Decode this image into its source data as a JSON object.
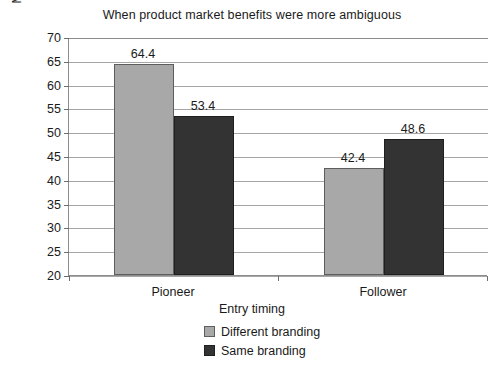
{
  "chart_data": {
    "type": "bar",
    "title": "When product market benefits were more ambiguous",
    "xlabel": "Entry timing",
    "ylabel": "Market share (%)",
    "categories": [
      "Pioneer",
      "Follower"
    ],
    "series": [
      {
        "name": "Different branding",
        "color": "#a8a8a8",
        "values": [
          64.4,
          42.4
        ]
      },
      {
        "name": "Same branding",
        "color": "#333333",
        "values": [
          53.4,
          48.6
        ]
      }
    ],
    "ylim": [
      20,
      70
    ],
    "ytick_step": 5,
    "yticks": [
      70,
      65,
      60,
      55,
      50,
      45,
      40,
      35,
      30,
      25,
      20
    ],
    "ytick_labels": [
      "70",
      "65",
      "60",
      "55",
      "50",
      "45",
      "40",
      "35",
      "30",
      "25",
      "20"
    ],
    "value_labels": [
      "64.4",
      "53.4",
      "42.4",
      "48.6"
    ],
    "grid": true,
    "legend_position": "bottom-center",
    "background": "#ffffff",
    "axis_color": "#8d8d8d",
    "gridline_color": "#a6a6a6"
  }
}
